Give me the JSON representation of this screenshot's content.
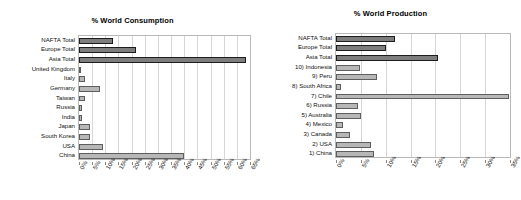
{
  "charts": [
    {
      "id": "consumption",
      "title": "% World Consumption"
    },
    {
      "id": "production",
      "title": "% World Production"
    }
  ],
  "chart_data": [
    {
      "type": "bar",
      "orientation": "horizontal",
      "title": "% World Consumption",
      "xlabel": "",
      "ylabel": "",
      "xlim": [
        0,
        65
      ],
      "xticks": [
        "0%",
        "5%",
        "10%",
        "15%",
        "20%",
        "25%",
        "30%",
        "35%",
        "40%",
        "45%",
        "50%",
        "55%",
        "60%",
        "65%"
      ],
      "xtick_values": [
        0,
        5,
        10,
        15,
        20,
        25,
        30,
        35,
        40,
        45,
        50,
        55,
        60,
        65
      ],
      "grid": true,
      "legend": "none",
      "categories": [
        "NAFTA Total",
        "Europe Total",
        "Asia Total",
        "United Kingdom",
        "Italy",
        "Germany",
        "Taiwan",
        "Russia",
        "India",
        "Japan",
        "South Korea",
        "USA",
        "China"
      ],
      "values": [
        13.0,
        21.5,
        63.5,
        0.8,
        2.3,
        8.0,
        2.2,
        1.0,
        1.3,
        4.0,
        4.0,
        9.0,
        40.0
      ],
      "series_group": [
        "total",
        "total",
        "total",
        "country",
        "country",
        "country",
        "country",
        "country",
        "country",
        "country",
        "country",
        "country",
        "country"
      ]
    },
    {
      "type": "bar",
      "orientation": "horizontal",
      "title": "% World Production",
      "xlabel": "",
      "ylabel": "",
      "xlim": [
        0,
        35
      ],
      "xticks": [
        "0%",
        "5%",
        "10%",
        "15%",
        "20%",
        "25%",
        "30%",
        "35%"
      ],
      "xtick_values": [
        0,
        5,
        10,
        15,
        20,
        25,
        30,
        35
      ],
      "grid": true,
      "legend": "none",
      "categories": [
        "NAFTA Total",
        "Europe Total",
        "Asia Total",
        "10) Indonesia",
        "9) Peru",
        "8) South Africa",
        "7) Chile",
        "6) Russia",
        "5) Australia",
        "4) Mexico",
        "3) Canada",
        "2) USA",
        "1) China"
      ],
      "values": [
        11.8,
        10.0,
        20.5,
        4.8,
        8.3,
        1.1,
        34.8,
        4.4,
        5.0,
        1.4,
        2.9,
        7.0,
        7.7
      ],
      "series_group": [
        "total",
        "total",
        "total",
        "country",
        "country",
        "country",
        "country",
        "country",
        "country",
        "country",
        "country",
        "country",
        "country"
      ]
    }
  ],
  "style": {
    "total_fill": "#7d7d7d",
    "total_edge": "#1d1d1d",
    "country_fill": "#b7b7b7",
    "country_edge": "#5e5e5e",
    "grid_color": "#d6d6d6",
    "axis_color": "#b9b9b9",
    "background": "#ffffff"
  }
}
